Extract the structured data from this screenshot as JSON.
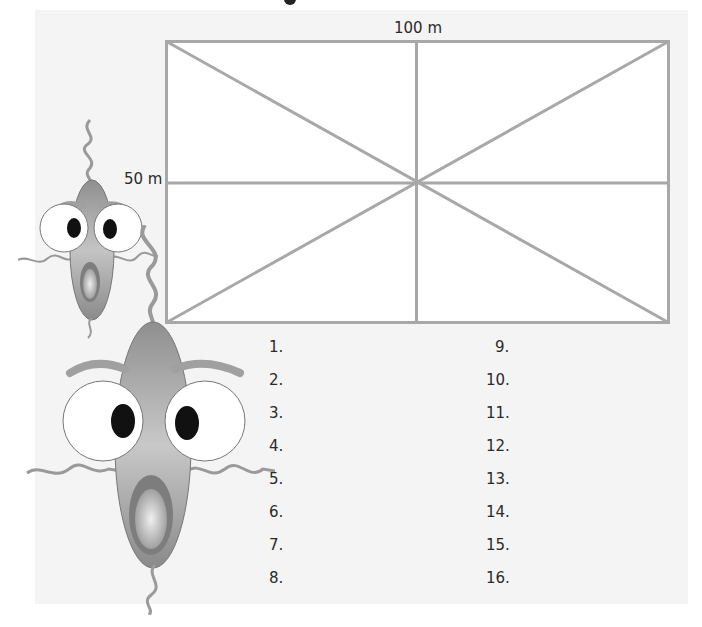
{
  "header": {
    "cropped_text_fragment": ""
  },
  "diagram": {
    "width_label": "100 m",
    "height_label": "50 m",
    "line_color": "#a8a8a8",
    "fill_color": "#ffffff"
  },
  "answer_list": {
    "left_column": [
      "1.",
      "2.",
      "3.",
      "4.",
      "5.",
      "6.",
      "7.",
      "8."
    ],
    "right_column": [
      "9.",
      "10.",
      "11.",
      "12.",
      "13.",
      "14.",
      "15.",
      "16."
    ]
  },
  "illustrations": {
    "small_character": "surprised-worm-character",
    "large_character": "surprised-worm-character"
  },
  "colors": {
    "panel_background": "#f4f4f4",
    "character_body": "#9a9a9a",
    "eye_white": "#ffffff",
    "pupil": "#111111"
  }
}
